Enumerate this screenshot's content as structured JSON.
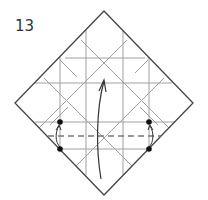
{
  "diagram": {
    "type": "origami-step",
    "step_number": "13",
    "colors": {
      "outline": "#444444",
      "crease": "#9a9a9a",
      "arrow": "#333333",
      "valley_fold": "#777777",
      "dot": "#111111",
      "background": "#ffffff"
    },
    "paper": {
      "shape": "square-rotated-45",
      "vertices": {
        "top": [
          104,
          11
        ],
        "right": [
          193,
          103
        ],
        "bottom": [
          104,
          195
        ],
        "left": [
          15,
          103
        ]
      }
    },
    "creases": {
      "vertical_x": [
        60,
        86,
        123,
        149
      ],
      "horizontal_y": [
        58,
        83,
        122,
        149
      ]
    },
    "valley_fold_line": {
      "y": 136,
      "x_from": 48,
      "x_to": 161,
      "style": "dashed"
    },
    "main_arrow": {
      "from": [
        100,
        178
      ],
      "to": [
        104,
        80
      ],
      "meaning": "fold bottom up"
    },
    "reference_dots": [
      {
        "x": 60,
        "y": 122
      },
      {
        "x": 60,
        "y": 149
      },
      {
        "x": 149,
        "y": 122
      },
      {
        "x": 149,
        "y": 149
      }
    ],
    "small_arrows": [
      {
        "side": "left",
        "from": [
          60,
          149
        ],
        "to": [
          60,
          125
        ]
      },
      {
        "side": "right",
        "from": [
          149,
          149
        ],
        "to": [
          149,
          125
        ]
      }
    ]
  }
}
